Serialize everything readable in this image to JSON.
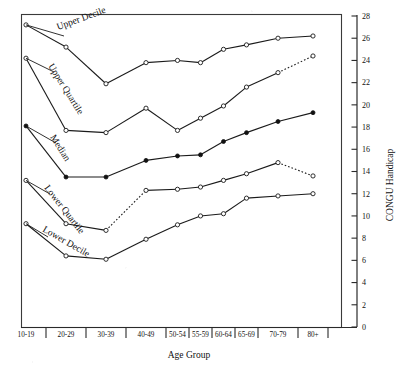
{
  "chart_data": {
    "type": "line",
    "title": "",
    "xlabel": "Age Group",
    "ylabel": "CONGU Handicap",
    "categories": [
      "10-19",
      "20-29",
      "30-39",
      "40-49",
      "50-54",
      "55-59",
      "60-64",
      "65-69",
      "70-79",
      "80+"
    ],
    "ylim": [
      0,
      28
    ],
    "ytick_labels": [
      "0",
      "2",
      "4",
      "6",
      "8",
      "10",
      "12",
      "14",
      "16",
      "18",
      "20",
      "22",
      "24",
      "26",
      "28"
    ],
    "ytick_values": [
      0,
      2,
      4,
      6,
      8,
      10,
      12,
      14,
      16,
      18,
      20,
      22,
      24,
      26,
      28
    ],
    "y_axis_position": "right",
    "grid": false,
    "legend": "inline-series-labels",
    "series": [
      {
        "name": "Upper Decile",
        "marker": "open-circle",
        "values": [
          27.2,
          25.2,
          21.9,
          23.8,
          24.0,
          23.8,
          25.0,
          25.4,
          26.0,
          26.2
        ],
        "dotted_segments": []
      },
      {
        "name": "Upper Quartile",
        "marker": "open-circle",
        "values": [
          24.2,
          17.7,
          17.5,
          19.7,
          17.7,
          18.8,
          19.9,
          21.6,
          22.9,
          24.4
        ],
        "dotted_segments": [
          [
            8,
            9
          ]
        ]
      },
      {
        "name": "Median",
        "marker": "filled-circle",
        "values": [
          18.1,
          13.5,
          13.5,
          15.0,
          15.4,
          15.5,
          16.7,
          17.5,
          18.5,
          19.3
        ],
        "dotted_segments": []
      },
      {
        "name": "Lower Quartile",
        "marker": "open-circle",
        "values": [
          13.2,
          9.3,
          8.7,
          12.3,
          12.4,
          12.6,
          13.2,
          13.8,
          14.8,
          13.6
        ],
        "dotted_segments": [
          [
            2,
            3
          ],
          [
            8,
            9
          ]
        ]
      },
      {
        "name": "Lower Decile",
        "marker": "open-circle",
        "values": [
          9.3,
          6.4,
          6.1,
          7.9,
          9.2,
          10.0,
          10.2,
          11.6,
          11.8,
          12.0
        ],
        "dotted_segments": []
      }
    ],
    "series_label_anchors": [
      {
        "name": "Upper Decile",
        "x": 58,
        "y": 30,
        "angle": -20
      },
      {
        "name": "Upper Quartile",
        "x": 48,
        "y": 66,
        "angle": 58
      },
      {
        "name": "Median",
        "x": 50,
        "y": 137,
        "angle": 58
      },
      {
        "name": "Lower Quartile",
        "x": 44,
        "y": 188,
        "angle": 52
      },
      {
        "name": "Lower Decile",
        "x": 42,
        "y": 231,
        "angle": 30
      }
    ],
    "colors": {
      "line": "#1a1a1a",
      "frame": "#3a3a3a",
      "text": "#111111",
      "background": "#ffffff"
    }
  }
}
